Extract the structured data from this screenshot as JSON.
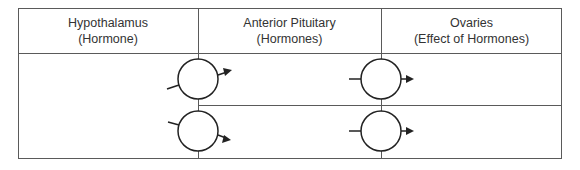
{
  "table": {
    "columns": [
      {
        "title": "Hypothalamus",
        "subtitle": "(Hormone)"
      },
      {
        "title": "Anterior Pituitary",
        "subtitle": "(Hormones)"
      },
      {
        "title": "Ovaries",
        "subtitle": "(Effect of Hormones)"
      }
    ],
    "rows": [
      {
        "hypothalamus": "",
        "anterior_pituitary": "",
        "ovaries": ""
      },
      {
        "hypothalamus": "",
        "anterior_pituitary": "",
        "ovaries": ""
      }
    ]
  },
  "diagram": {
    "line_color": "#555555",
    "circle_color": "#222222",
    "connector_circles": [
      {
        "id": "hypo-to-pit-1",
        "cx": 198,
        "cy": 79,
        "input": "left-diagonal",
        "output": "arrow-right-up"
      },
      {
        "id": "hypo-to-pit-2",
        "cx": 198,
        "cy": 131,
        "input": "left-diagonal",
        "output": "arrow-right-down"
      },
      {
        "id": "pit-to-ovary-1",
        "cx": 381,
        "cy": 79,
        "input": "left",
        "output": "arrow-right"
      },
      {
        "id": "pit-to-ovary-2",
        "cx": 381,
        "cy": 131,
        "input": "left",
        "output": "arrow-right"
      }
    ]
  }
}
